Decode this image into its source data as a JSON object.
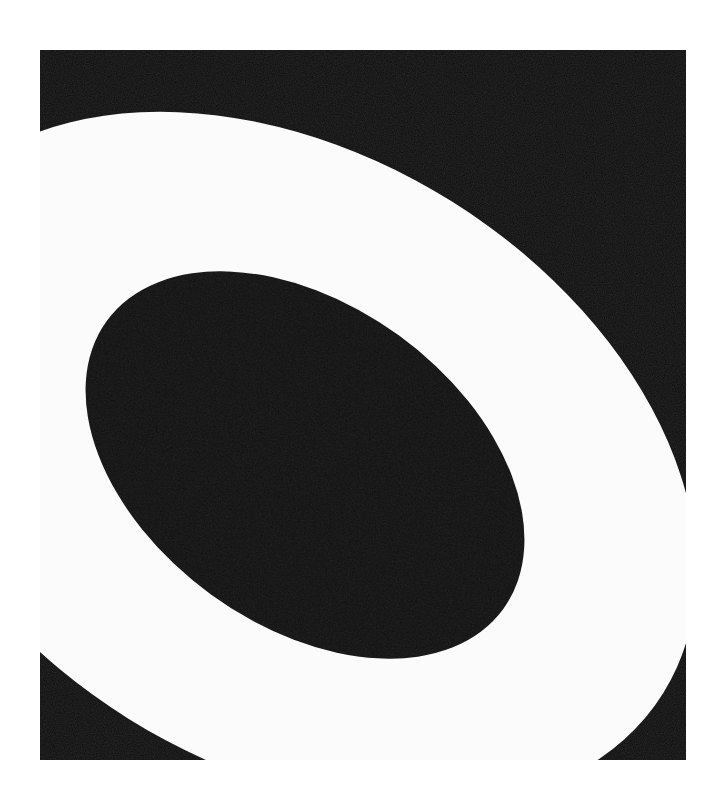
{
  "artwork": {
    "description": "Abstract painting: white elliptical ring on black ground with black elliptical center",
    "colors": {
      "background": "#ffffff",
      "ground": "#0c0c0c",
      "ring": "#fbfbfb",
      "center": "#0a0a0a"
    }
  }
}
